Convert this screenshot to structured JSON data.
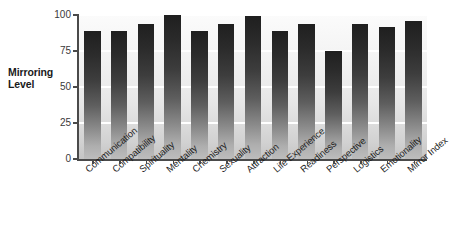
{
  "chart_data": {
    "type": "bar",
    "title": "",
    "xlabel": "",
    "ylabel": "Mirroring Level",
    "ylabel_lines": [
      "Mirroring",
      "Level"
    ],
    "categories": [
      "Communication",
      "Compatibility",
      "Spirituality",
      "Mentality",
      "Chemistry",
      "Sexuality",
      "Attraction",
      "Life Experience",
      "Readiness",
      "Perspective",
      "Logistics",
      "Emotionality",
      "Mirror Index"
    ],
    "values": [
      89,
      89,
      94,
      100,
      89,
      94,
      99,
      89,
      94,
      75,
      94,
      92,
      96
    ],
    "ylim": [
      0,
      100
    ],
    "yticks": [
      0,
      25,
      50,
      75,
      100
    ],
    "ytick_labels": [
      "0",
      "25",
      "50",
      "75",
      "100"
    ],
    "grid": true,
    "grid_color": "#ffffff",
    "legend": null,
    "bar_color_top": "#1f1f1f",
    "bar_color_bottom": "#bdbdbd",
    "plot_background_top": "#fbfbfb",
    "plot_background_bottom": "#c4c4c4",
    "axis_color": "#4a4a4a",
    "text_color": "#1d1d1d"
  }
}
